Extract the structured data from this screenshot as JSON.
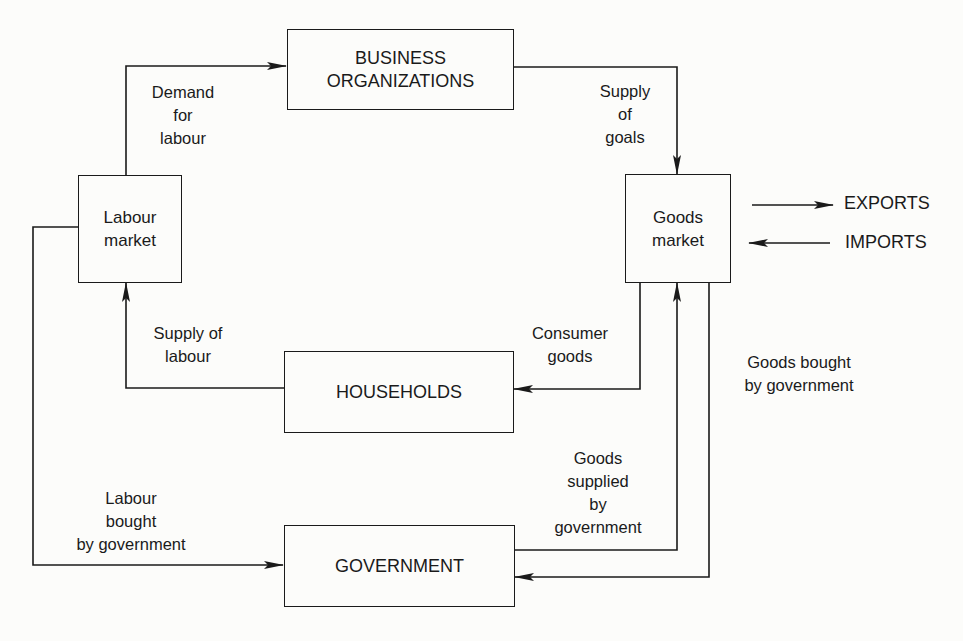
{
  "diagram": {
    "type": "circular-flow",
    "nodes": {
      "business": "BUSINESS\nORGANIZATIONS",
      "labour_market": "Labour\nmarket",
      "goods_market": "Goods\nmarket",
      "households": "HOUSEHOLDS",
      "government": "GOVERNMENT"
    },
    "external": {
      "exports": "EXPORTS",
      "imports": "IMPORTS"
    },
    "flows": {
      "demand_for_labour": "Demand\nfor\nlabour",
      "supply_of_goals": "Supply\nof\ngoals",
      "supply_of_labour": "Supply of\nlabour",
      "consumer_goods": "Consumer\ngoods",
      "goods_bought_by_government": "Goods bought\nby government",
      "goods_supplied_by_government": "Goods\nsupplied\nby\ngovernment",
      "labour_bought_by_government": "Labour\nbought\nby government"
    },
    "edges": [
      {
        "from": "labour_market",
        "to": "business",
        "label": "demand_for_labour"
      },
      {
        "from": "business",
        "to": "goods_market",
        "label": "supply_of_goals"
      },
      {
        "from": "households",
        "to": "labour_market",
        "label": "supply_of_labour"
      },
      {
        "from": "goods_market",
        "to": "households",
        "label": "consumer_goods"
      },
      {
        "from": "goods_market",
        "to": "government",
        "label": "goods_bought_by_government"
      },
      {
        "from": "government",
        "to": "goods_market",
        "label": "goods_supplied_by_government"
      },
      {
        "from": "labour_market",
        "to": "government",
        "label": "labour_bought_by_government"
      },
      {
        "from": "goods_market",
        "to": "exports",
        "label": ""
      },
      {
        "from": "imports",
        "to": "goods_market",
        "label": ""
      }
    ]
  }
}
